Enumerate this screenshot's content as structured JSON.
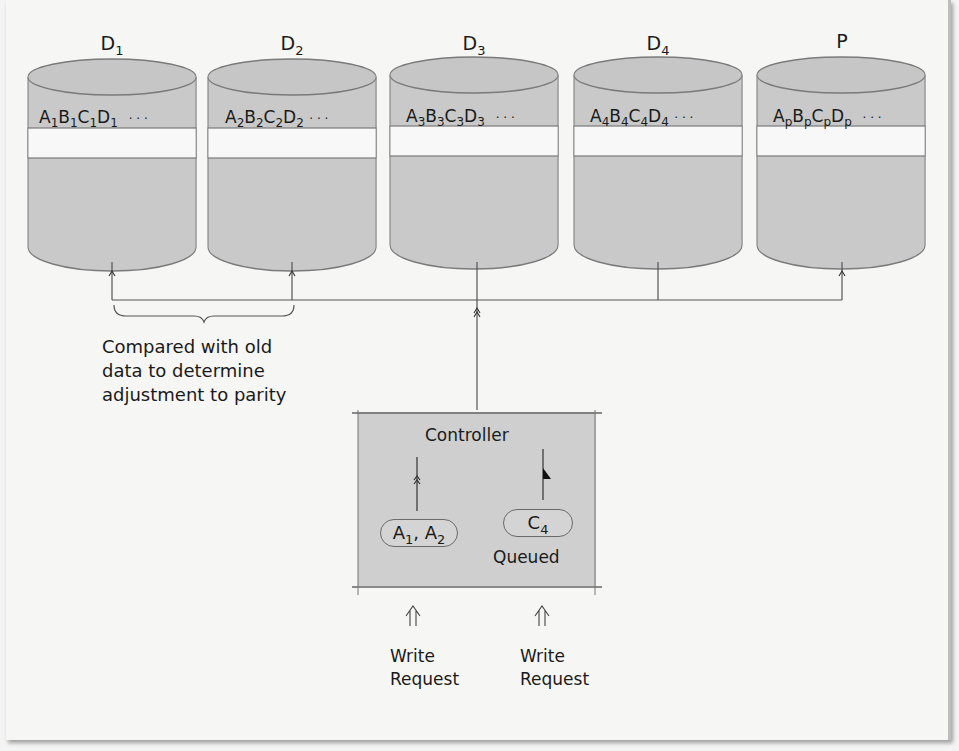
{
  "diagram": {
    "disks": [
      {
        "name": "D",
        "sub": "1",
        "stripe": [
          {
            "b": "A",
            "s": "1"
          },
          {
            "b": "B",
            "s": "1"
          },
          {
            "b": "C",
            "s": "1"
          },
          {
            "b": "D",
            "s": "1"
          }
        ],
        "ellipsis": "· · ·"
      },
      {
        "name": "D",
        "sub": "2",
        "stripe": [
          {
            "b": "A",
            "s": "2"
          },
          {
            "b": "B",
            "s": "2"
          },
          {
            "b": "C",
            "s": "2"
          },
          {
            "b": "D",
            "s": "2"
          }
        ],
        "ellipsis": "· · ·"
      },
      {
        "name": "D",
        "sub": "3",
        "stripe": [
          {
            "b": "A",
            "s": "3"
          },
          {
            "b": "B",
            "s": "3"
          },
          {
            "b": "C",
            "s": "3"
          },
          {
            "b": "D",
            "s": "3"
          }
        ],
        "ellipsis": "· · ·"
      },
      {
        "name": "D",
        "sub": "4",
        "stripe": [
          {
            "b": "A",
            "s": "4"
          },
          {
            "b": "B",
            "s": "4"
          },
          {
            "b": "C",
            "s": "4"
          },
          {
            "b": "D",
            "s": "4"
          }
        ],
        "ellipsis": "· · ·"
      },
      {
        "name": "P",
        "sub": "",
        "stripe": [
          {
            "b": "A",
            "s": "p"
          },
          {
            "b": "B",
            "s": "p"
          },
          {
            "b": "C",
            "s": "p"
          },
          {
            "b": "D",
            "s": "p"
          }
        ],
        "ellipsis": "· · ·"
      }
    ],
    "brace_note": {
      "line1": "Compared with old",
      "line2": "data to determine",
      "line3": "adjustment to parity"
    },
    "controller": {
      "title": "Controller",
      "left_pill": {
        "a": "A",
        "a_sub": "1",
        "sep": ", ",
        "b": "A",
        "b_sub": "2"
      },
      "right_pill": {
        "c": "C",
        "c_sub": "4"
      },
      "queued_label": "Queued"
    },
    "requests": [
      {
        "line1": "Write",
        "line2": "Request"
      },
      {
        "line1": "Write",
        "line2": "Request"
      }
    ],
    "colors": {
      "disk_fill": "#c9c9c9",
      "disk_stroke": "#777777",
      "stripe_fill": "#f8f8f8",
      "controller_fill": "#cfcfcf",
      "line": "#555555"
    }
  }
}
